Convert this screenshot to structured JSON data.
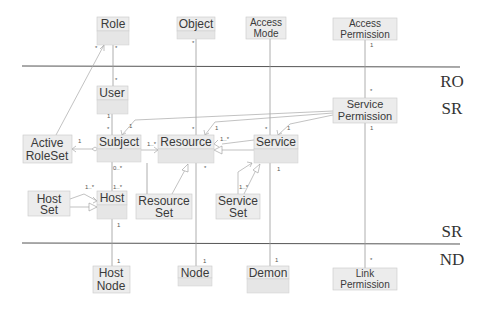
{
  "layers": [
    {
      "label": "RO",
      "x": 454,
      "y": 87,
      "line_y": 66
    },
    {
      "label": "SR",
      "x": 454,
      "y": 114,
      "line_y": null
    },
    {
      "label": "SR",
      "x": 454,
      "y": 235,
      "line_y": 243
    },
    {
      "label": "ND",
      "x": 454,
      "y": 262,
      "line_y": null
    }
  ],
  "classes": [
    {
      "id": "role",
      "lines": [
        "Role"
      ],
      "x": 97,
      "y": 17,
      "w": 32,
      "h": 28
    },
    {
      "id": "object",
      "lines": [
        "Object"
      ],
      "x": 177,
      "y": 17,
      "w": 38,
      "h": 22
    },
    {
      "id": "access-mode",
      "lines": [
        "Access",
        "Mode"
      ],
      "x": 246,
      "y": 17,
      "w": 40,
      "h": 22
    },
    {
      "id": "access-permission",
      "lines": [
        "Access",
        "Permission"
      ],
      "x": 333,
      "y": 18,
      "w": 64,
      "h": 22
    },
    {
      "id": "user",
      "lines": [
        "User"
      ],
      "x": 97,
      "y": 86,
      "w": 31,
      "h": 28
    },
    {
      "id": "service-permission",
      "lines": [
        "Service",
        "Permission"
      ],
      "x": 333,
      "y": 98,
      "w": 64,
      "h": 25
    },
    {
      "id": "active-roleset",
      "lines": [
        "Active",
        "RoleSet"
      ],
      "x": 23,
      "y": 135,
      "w": 49,
      "h": 28
    },
    {
      "id": "subject",
      "lines": [
        "Subject"
      ],
      "x": 97,
      "y": 135,
      "w": 44,
      "h": 27
    },
    {
      "id": "resource",
      "lines": [
        "Resource"
      ],
      "x": 158,
      "y": 135,
      "w": 56,
      "h": 28
    },
    {
      "id": "service",
      "lines": [
        "Service"
      ],
      "x": 254,
      "y": 135,
      "w": 44,
      "h": 28
    },
    {
      "id": "host-set",
      "lines": [
        "Host",
        "Set"
      ],
      "x": 28,
      "y": 191,
      "w": 42,
      "h": 25
    },
    {
      "id": "host",
      "lines": [
        "Host"
      ],
      "x": 97,
      "y": 191,
      "w": 30,
      "h": 28
    },
    {
      "id": "resource-set",
      "lines": [
        "Resource",
        "Set"
      ],
      "x": 136,
      "y": 194,
      "w": 56,
      "h": 25
    },
    {
      "id": "service-set",
      "lines": [
        "Service",
        "Set"
      ],
      "x": 216,
      "y": 194,
      "w": 44,
      "h": 25
    },
    {
      "id": "host-node",
      "lines": [
        "Host",
        "Node"
      ],
      "x": 93,
      "y": 266,
      "w": 37,
      "h": 27
    },
    {
      "id": "node",
      "lines": [
        "Node"
      ],
      "x": 178,
      "y": 266,
      "w": 34,
      "h": 20
    },
    {
      "id": "demon",
      "lines": [
        "Demon"
      ],
      "x": 247,
      "y": 266,
      "w": 42,
      "h": 27
    },
    {
      "id": "link-permission",
      "lines": [
        "Link",
        "Permission"
      ],
      "x": 333,
      "y": 268,
      "w": 64,
      "h": 22
    }
  ],
  "multiplicities": [
    {
      "text": "*",
      "x": 95,
      "y": 50
    },
    {
      "text": "*",
      "x": 115,
      "y": 50
    },
    {
      "text": "*",
      "x": 192,
      "y": 45
    },
    {
      "text": "1",
      "x": 370,
      "y": 47
    },
    {
      "text": "*",
      "x": 115,
      "y": 82
    },
    {
      "text": "*",
      "x": 370,
      "y": 93
    },
    {
      "text": "1",
      "x": 107,
      "y": 118
    },
    {
      "text": "*",
      "x": 107,
      "y": 131
    },
    {
      "text": "1",
      "x": 129,
      "y": 128
    },
    {
      "text": "1",
      "x": 78,
      "y": 143
    },
    {
      "text": "1..*",
      "x": 147,
      "y": 146
    },
    {
      "text": "*",
      "x": 192,
      "y": 131
    },
    {
      "text": "1",
      "x": 215,
      "y": 130
    },
    {
      "text": "1..*",
      "x": 220,
      "y": 141
    },
    {
      "text": "*",
      "x": 265,
      "y": 131
    },
    {
      "text": "1",
      "x": 287,
      "y": 130
    },
    {
      "text": "1",
      "x": 370,
      "y": 130
    },
    {
      "text": "0..*",
      "x": 113,
      "y": 170
    },
    {
      "text": "*",
      "x": 204,
      "y": 170
    },
    {
      "text": "1",
      "x": 277,
      "y": 171
    },
    {
      "text": "1..*",
      "x": 85,
      "y": 189
    },
    {
      "text": "1..*",
      "x": 113,
      "y": 189
    },
    {
      "text": "1..*",
      "x": 239,
      "y": 189
    },
    {
      "text": "1",
      "x": 117,
      "y": 227
    },
    {
      "text": "1",
      "x": 117,
      "y": 263
    },
    {
      "text": "1",
      "x": 203,
      "y": 263
    },
    {
      "text": "1",
      "x": 275,
      "y": 262
    },
    {
      "text": "*",
      "x": 370,
      "y": 262
    }
  ],
  "relations": [
    {
      "from": "active-roleset",
      "to": "role",
      "type": "navigable"
    },
    {
      "from": "subject",
      "to": "active-roleset",
      "type": "aggregation"
    },
    {
      "from": "user",
      "to": "subject",
      "type": "association"
    },
    {
      "from": "role",
      "to": "user",
      "type": "association"
    },
    {
      "from": "subject",
      "to": "resource",
      "type": "navigable"
    },
    {
      "from": "service",
      "to": "resource",
      "type": "generalization"
    },
    {
      "from": "resource-set",
      "to": "resource",
      "type": "generalization"
    },
    {
      "from": "service-set",
      "to": "service",
      "type": "generalization"
    },
    {
      "from": "service-permission",
      "to": "subject",
      "type": "navigable"
    },
    {
      "from": "service-permission",
      "to": "resource",
      "type": "navigable"
    },
    {
      "from": "service-permission",
      "to": "service",
      "type": "navigable"
    },
    {
      "from": "host-set",
      "to": "host",
      "type": "generalization"
    },
    {
      "from": "host",
      "to": "host-node",
      "type": "association"
    },
    {
      "from": "object",
      "to": "node",
      "type": "association"
    },
    {
      "from": "access-mode",
      "to": "demon",
      "type": "association"
    },
    {
      "from": "access-permission",
      "to": "link-permission",
      "type": "association"
    }
  ]
}
